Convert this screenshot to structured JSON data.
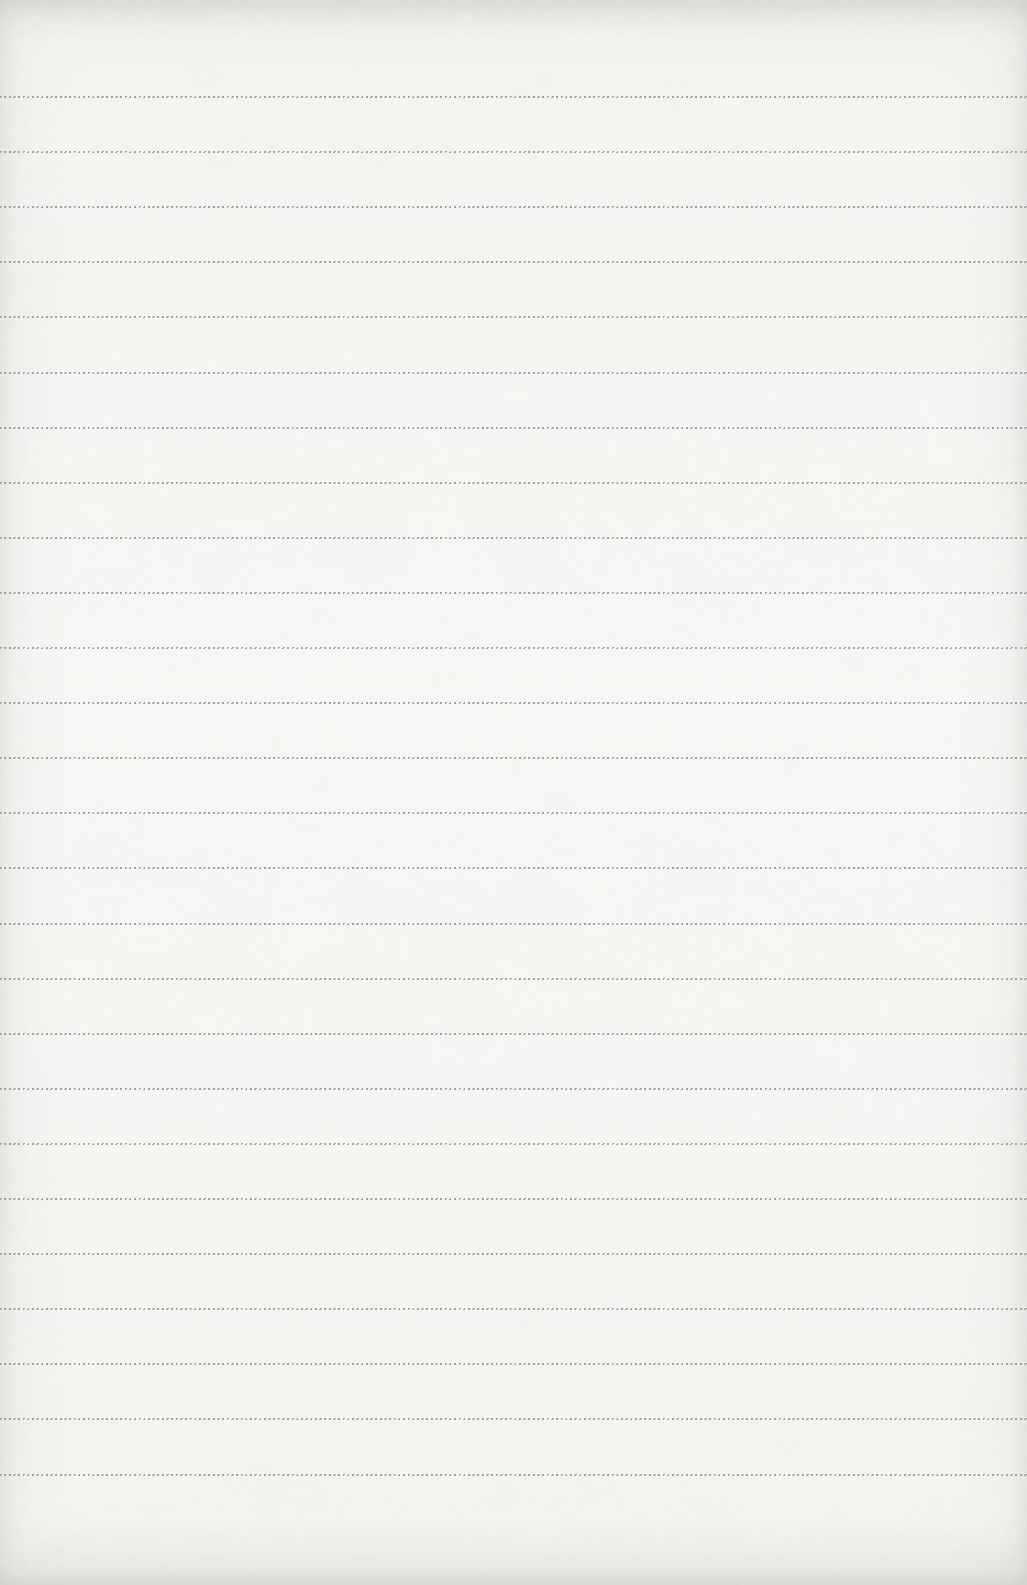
{
  "page": {
    "ruled_lines": {
      "count": 26,
      "first_line_top_px": 96,
      "spacing_px": 55.1,
      "color": "#8e8e8e",
      "style": "fine-dashed"
    },
    "paper": {
      "base_color": "#f6f5f2",
      "light_color": "#f9f8f6",
      "edge_color": "#eceae7"
    }
  }
}
